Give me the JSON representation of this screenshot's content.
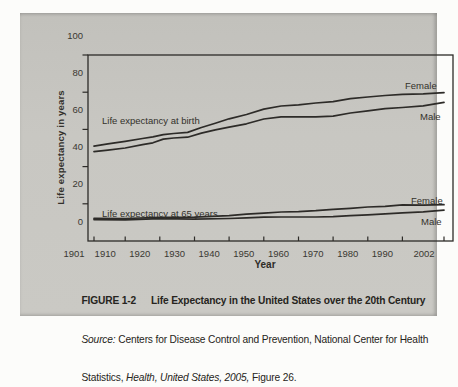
{
  "figure": {
    "caption": {
      "label": "FIGURE 1-2",
      "title": "Life Expectancy in the United States over the 20th Century",
      "source": {
        "source_word": "Source:",
        "line2_rest": " Centers for Disease Control and Prevention, National Center for Health",
        "line3_start": "Statistics, ",
        "line3_italic": "Health, United States, 2005,",
        "line3_end": " Figure 26."
      }
    }
  },
  "chart_data": {
    "type": "line",
    "title": "Life Expectancy in the United States over the 20th Century",
    "xlabel": "Year",
    "ylabel": "Life expectancy in years",
    "xlim": [
      1901,
      2002
    ],
    "ylim": [
      0,
      100
    ],
    "grid": false,
    "legend": "direct-line-labels",
    "line_color": "#2d2b28",
    "x_ticks": [
      1901,
      1910,
      1920,
      1930,
      1940,
      1950,
      1960,
      1970,
      1980,
      1990,
      2002
    ],
    "y_ticks": [
      0,
      20,
      40,
      60,
      80,
      100
    ],
    "annotations": {
      "birth": "Life expectancy at birth",
      "at65": "Life expectancy at 65 years"
    },
    "series": [
      {
        "name": "Female life expectancy at birth",
        "label": "Female",
        "x": [
          1901,
          1905,
          1910,
          1915,
          1918,
          1921,
          1924,
          1928,
          1932,
          1936,
          1940,
          1945,
          1950,
          1955,
          1960,
          1965,
          1970,
          1975,
          1980,
          1985,
          1990,
          1996,
          2002
        ],
        "values": [
          51.0,
          52.2,
          53.6,
          55.1,
          56.0,
          57.2,
          57.8,
          58.4,
          61.0,
          63.3,
          65.7,
          68.0,
          70.9,
          72.6,
          73.2,
          74.2,
          74.9,
          76.5,
          77.4,
          78.2,
          78.8,
          79.1,
          79.8
        ]
      },
      {
        "name": "Male life expectancy at birth",
        "label": "Male",
        "x": [
          1901,
          1905,
          1910,
          1915,
          1918,
          1921,
          1924,
          1928,
          1932,
          1936,
          1940,
          1945,
          1950,
          1955,
          1960,
          1965,
          1970,
          1975,
          1980,
          1985,
          1990,
          1996,
          2002
        ],
        "values": [
          48.0,
          48.8,
          50.0,
          51.8,
          52.8,
          54.8,
          55.4,
          55.8,
          58.0,
          59.8,
          61.2,
          63.0,
          65.6,
          66.7,
          66.8,
          66.8,
          67.1,
          68.8,
          70.0,
          71.2,
          71.8,
          72.7,
          74.5
        ]
      },
      {
        "name": "Female life expectancy at 65 years",
        "label": "Female",
        "x": [
          1901,
          1910,
          1920,
          1930,
          1940,
          1945,
          1950,
          1955,
          1960,
          1965,
          1970,
          1975,
          1980,
          1985,
          1990,
          1996,
          2002
        ],
        "values": [
          12.2,
          12.1,
          12.7,
          12.8,
          13.6,
          14.4,
          15.0,
          15.6,
          15.8,
          16.3,
          17.0,
          17.6,
          18.3,
          18.6,
          19.4,
          19.3,
          19.5
        ]
      },
      {
        "name": "Male life expectancy at 65 years",
        "label": "Male",
        "x": [
          1901,
          1910,
          1920,
          1930,
          1940,
          1945,
          1950,
          1955,
          1960,
          1965,
          1970,
          1975,
          1980,
          1985,
          1990,
          1996,
          2002
        ],
        "values": [
          11.5,
          11.4,
          12.0,
          11.8,
          12.1,
          12.4,
          12.8,
          12.9,
          12.9,
          12.9,
          13.1,
          13.6,
          14.1,
          14.6,
          15.1,
          15.7,
          16.6
        ]
      }
    ]
  }
}
